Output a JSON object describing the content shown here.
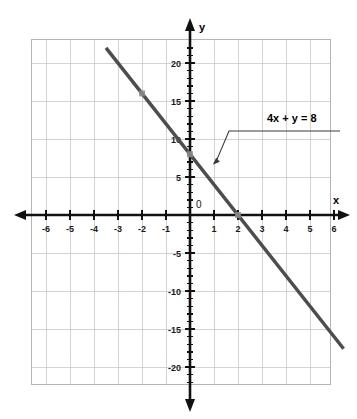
{
  "chart_data": {
    "type": "line",
    "title": "",
    "xlabel": "x",
    "ylabel": "y",
    "equation": "4x + y = 8",
    "grid": true,
    "legend_position": "annotation-callout",
    "xlim": [
      -7,
      7
    ],
    "ylim": [
      -22.5,
      22.5
    ],
    "x_ticks": [
      -6,
      -5,
      -4,
      -3,
      -2,
      -1,
      1,
      2,
      3,
      4,
      5,
      6
    ],
    "x_tick_labels": [
      "-6",
      "-5",
      "-4",
      "-3",
      "-2",
      "-1",
      "1",
      "2",
      "3",
      "4",
      "5",
      "6"
    ],
    "y_ticks": [
      -20,
      -15,
      -10,
      -5,
      5,
      10,
      15,
      20
    ],
    "y_tick_labels": [
      "-20",
      "-15",
      "-10",
      "-5",
      "5",
      "10",
      "15",
      "20"
    ],
    "origin_label": "0",
    "x_minor_tick_step": 1,
    "y_minor_tick_step": 1,
    "x_major_grid_step": 1,
    "y_major_grid_step": 5,
    "series": [
      {
        "name": "4x + y = 8",
        "slope": -4,
        "y_intercept": 8,
        "x_intercept": 2,
        "x": [
          -3.5,
          6.4
        ],
        "values": [
          22,
          -17.6
        ],
        "color": "#4d4d4d",
        "width": 3.5
      }
    ],
    "annotations": [
      {
        "text": "4x + y = 8",
        "text_x": 5.1,
        "text_y": 13.2,
        "points_to_x": 0.95,
        "points_to_y": 6.6
      }
    ],
    "markers": [
      {
        "x": 0,
        "y": 8,
        "label": "y-intercept"
      },
      {
        "x": 2,
        "y": 0,
        "label": "x-intercept"
      },
      {
        "x": -2,
        "y": 16,
        "label": "line-point"
      }
    ]
  },
  "colors": {
    "background": "#ffffff",
    "grid": "#c8c8cd",
    "grid_border": "#b4b4ba",
    "axis": "#111111",
    "line": "#4d4d4d",
    "marker": "#8c8c8c",
    "callout": "#3a3a3a",
    "text": "#1a1a1a"
  },
  "axes": {
    "y_name": "y",
    "x_name": "x"
  }
}
